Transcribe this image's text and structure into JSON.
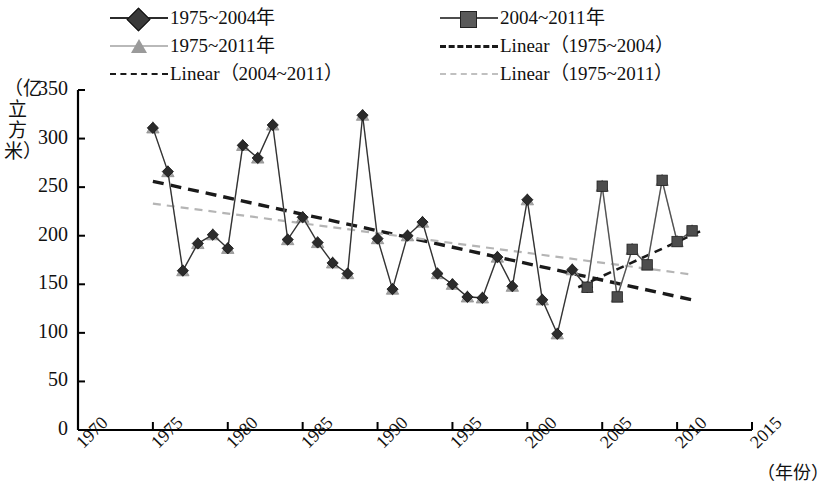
{
  "chart_data": {
    "type": "line",
    "title": "",
    "xlabel": "（年份）",
    "ylabel": "（亿立方米）",
    "xlim": [
      1970,
      2015
    ],
    "ylim": [
      0,
      350
    ],
    "xticks": [
      1970,
      1975,
      1980,
      1985,
      1990,
      1995,
      2000,
      2005,
      2010,
      2015
    ],
    "yticks": [
      0,
      50,
      100,
      150,
      200,
      250,
      300,
      350
    ],
    "grid": false,
    "legend_position": "top",
    "x": [
      1975,
      1976,
      1977,
      1978,
      1979,
      1980,
      1981,
      1982,
      1983,
      1984,
      1985,
      1986,
      1987,
      1988,
      1989,
      1990,
      1991,
      1992,
      1993,
      1994,
      1995,
      1996,
      1997,
      1998,
      1999,
      2000,
      2001,
      2002,
      2003,
      2004,
      2005,
      2006,
      2007,
      2008,
      2009,
      2010,
      2011
    ],
    "series": [
      {
        "name": "1975~2004年",
        "marker": "diamond",
        "color": "#2b2b2b",
        "values": [
          311,
          266,
          164,
          192,
          201,
          187,
          293,
          280,
          314,
          196,
          219,
          193,
          172,
          161,
          324,
          197,
          145,
          200,
          214,
          161,
          150,
          137,
          136,
          178,
          148,
          237,
          134,
          99,
          165,
          147,
          null,
          null,
          null,
          null,
          null,
          null,
          null
        ]
      },
      {
        "name": "2004~2011年",
        "marker": "square",
        "color": "#4d4d4d",
        "values": [
          null,
          null,
          null,
          null,
          null,
          null,
          null,
          null,
          null,
          null,
          null,
          null,
          null,
          null,
          null,
          null,
          null,
          null,
          null,
          null,
          null,
          null,
          null,
          null,
          null,
          null,
          null,
          null,
          null,
          147,
          251,
          137,
          186,
          170,
          257,
          194,
          205
        ]
      },
      {
        "name": "1975~2011年",
        "marker": "triangle",
        "color": "#9e9e9e",
        "values": [
          311,
          266,
          164,
          192,
          201,
          187,
          293,
          280,
          314,
          196,
          219,
          193,
          172,
          161,
          324,
          197,
          145,
          200,
          214,
          161,
          150,
          137,
          136,
          178,
          148,
          237,
          134,
          99,
          165,
          147,
          251,
          137,
          186,
          170,
          257,
          194,
          205
        ]
      }
    ],
    "trendlines": [
      {
        "name": "Linear（1975~2004）",
        "color": "#1a1a1a",
        "style": "dashed",
        "width": 3.4,
        "x_start": 1975,
        "y_start": 256,
        "x_end": 2011,
        "y_end": 134
      },
      {
        "name": "Linear（2004~2011）",
        "color": "#1a1a1a",
        "style": "dashed",
        "width": 2.6,
        "x_start": 2003.4,
        "y_start": 147,
        "x_end": 2011.6,
        "y_end": 205
      },
      {
        "name": "Linear（1975~2011）",
        "color": "#b5b5b5",
        "style": "dashed",
        "width": 2.2,
        "x_start": 1975,
        "y_start": 233,
        "x_end": 2011,
        "y_end": 160
      }
    ]
  },
  "legend": {
    "entries": [
      {
        "label": "1975~2004年",
        "kind": "marker",
        "marker": "diamond",
        "color": "#2b2b2b"
      },
      {
        "label": "2004~2011年",
        "kind": "marker",
        "marker": "square",
        "color": "#4d4d4d"
      },
      {
        "label": "1975~2011年",
        "kind": "marker",
        "marker": "triangle",
        "color": "#9e9e9e"
      },
      {
        "label": "Linear（1975~2004）",
        "kind": "dash",
        "color": "#1a1a1a"
      },
      {
        "label": "Linear（2004~2011）",
        "kind": "dash",
        "color": "#1a1a1a"
      },
      {
        "label": "Linear（1975~2011）",
        "kind": "dash",
        "color": "#b5b5b5"
      }
    ]
  },
  "axes": {
    "y_title": "（亿立方米）",
    "x_title": "（年份）",
    "y_tick_labels": [
      "350",
      "300",
      "250",
      "200",
      "150",
      "100",
      "50",
      "0"
    ],
    "x_tick_labels": [
      "1970",
      "1975",
      "1980",
      "1985",
      "1990",
      "1995",
      "2000",
      "2005",
      "2010",
      "2015"
    ]
  }
}
